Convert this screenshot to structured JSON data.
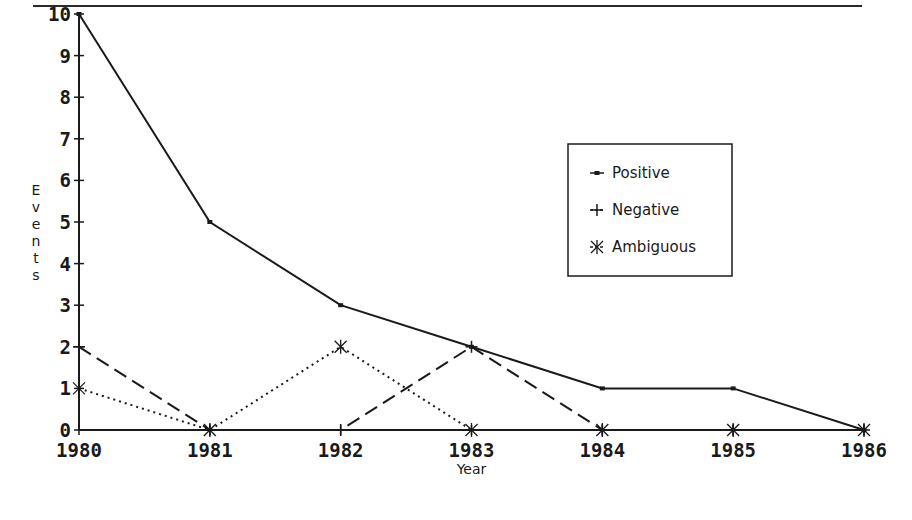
{
  "chart_data": {
    "type": "line",
    "title": "",
    "xlabel": "Year",
    "ylabel": "Events",
    "x": [
      1980,
      1981,
      1982,
      1983,
      1984,
      1985,
      1986
    ],
    "categories": [
      "1980",
      "1981",
      "1982",
      "1983",
      "1984",
      "1985",
      "1986"
    ],
    "ylim": [
      0,
      10
    ],
    "yticks": [
      0,
      1,
      2,
      3,
      4,
      5,
      6,
      7,
      8,
      9,
      10
    ],
    "grid": false,
    "legend_position": "upper right (inside plot)",
    "series": [
      {
        "name": "Positive",
        "values": [
          10,
          5,
          3,
          2,
          1,
          1,
          0
        ],
        "line_style": "solid",
        "marker": "small-square"
      },
      {
        "name": "Negative",
        "values": [
          2,
          0,
          0,
          2,
          0,
          0,
          0
        ],
        "line_style": "dashed",
        "marker": "plus"
      },
      {
        "name": "Ambiguous",
        "values": [
          1,
          0,
          2,
          0,
          0,
          0,
          0
        ],
        "line_style": "dotted",
        "marker": "asterisk"
      }
    ]
  },
  "layout": {
    "plot_left": 79,
    "plot_right": 864,
    "plot_top": 14,
    "plot_bottom": 430,
    "line_color": "#1a1a1a"
  }
}
